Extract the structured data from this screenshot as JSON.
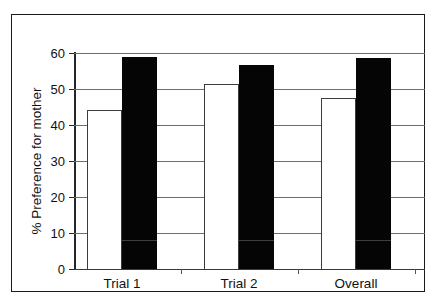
{
  "chart_data": {
    "type": "bar",
    "title": "",
    "subtitle": "",
    "xlabel": "",
    "ylabel": "% Preference for mother",
    "categories": [
      "Trial 1",
      "Trial 2",
      "Overall"
    ],
    "ylim": [
      0,
      60
    ],
    "ytick_labels": [
      "0",
      "10",
      "20",
      "30",
      "40",
      "50",
      "60"
    ],
    "ytick_values": [
      0,
      10,
      20,
      30,
      40,
      50,
      60
    ],
    "grid": "horizontal",
    "legend": "none",
    "series": [
      {
        "name": "open",
        "fill": "#ffffff",
        "edge": "#3d3d3d",
        "values": [
          44.2,
          51.4,
          47.5
        ]
      },
      {
        "name": "filled",
        "fill": "#050505",
        "edge": "#050505",
        "values": [
          58.9,
          56.7,
          58.6
        ]
      }
    ]
  },
  "axis": {
    "y_title": "% Preference for mother",
    "ticks": [
      {
        "label": "60",
        "value": 60
      },
      {
        "label": "50",
        "value": 50
      },
      {
        "label": "40",
        "value": 40
      },
      {
        "label": "30",
        "value": 30
      },
      {
        "label": "20",
        "value": 20
      },
      {
        "label": "10",
        "value": 10
      },
      {
        "label": "0",
        "value": 0
      }
    ]
  },
  "categories": [
    {
      "label": "Trial 1"
    },
    {
      "label": "Trial 2"
    },
    {
      "label": "Overall"
    }
  ],
  "colors": {
    "frame": "#1a1a1a",
    "grid": "#6e6e6e",
    "axis": "#262626",
    "bar_open": "#ffffff",
    "bar_filled": "#050505",
    "text": "#111111"
  }
}
